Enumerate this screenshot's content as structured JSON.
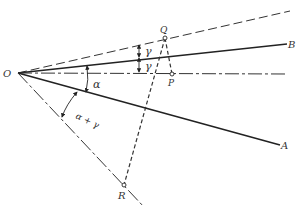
{
  "diagram": {
    "points": {
      "O": {
        "label": "O",
        "x": 18,
        "y": 73
      },
      "Q": {
        "label": "Q",
        "x": 165,
        "y": 38
      },
      "P": {
        "label": "P",
        "x": 172,
        "y": 74
      },
      "R": {
        "label": "R",
        "x": 124,
        "y": 185
      },
      "B": {
        "label": "B"
      },
      "A": {
        "label": "A"
      }
    },
    "angles": {
      "gamma_upper": "γ",
      "gamma_lower": "γ",
      "alpha": "α",
      "alpha_plus_gamma": "α + γ"
    },
    "colors": {
      "line": "#222222",
      "dashed": "#333333",
      "background": "#ffffff"
    }
  }
}
